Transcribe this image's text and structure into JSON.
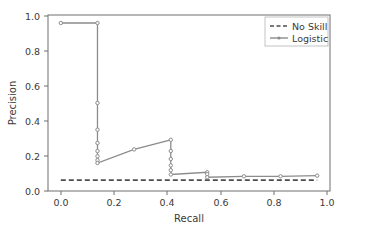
{
  "chart_data": {
    "type": "line",
    "title": "",
    "xlabel": "Recall",
    "ylabel": "Precision",
    "xlim": [
      -0.05,
      1.05
    ],
    "ylim": [
      -0.05,
      1.05
    ],
    "grid": false,
    "legend_position": "upper right",
    "xticks": [
      "0.0",
      "0.2",
      "0.4",
      "0.6",
      "0.8",
      "1.0"
    ],
    "xtick_values": [
      0.0,
      0.2,
      0.4,
      0.6,
      0.8,
      1.0
    ],
    "yticks": [
      "0.0",
      "0.2",
      "0.4",
      "0.6",
      "0.8",
      "1.0"
    ],
    "ytick_values": [
      0.0,
      0.2,
      0.4,
      0.6,
      0.8,
      1.0
    ],
    "series": [
      {
        "name": "No Skill",
        "style": "dashed",
        "marker": "none",
        "color": "#4d4d4d",
        "x": [
          0.0,
          1.0
        ],
        "values": [
          0.018,
          0.018
        ]
      },
      {
        "name": "Logistic",
        "style": "solid",
        "marker": "dot",
        "color": "#8c8c8c",
        "x": [
          0.0,
          0.143,
          0.143,
          0.143,
          0.143,
          0.143,
          0.143,
          0.143,
          0.143,
          0.286,
          0.429,
          0.429,
          0.429,
          0.429,
          0.429,
          0.429,
          0.571,
          0.571,
          0.571,
          0.714,
          0.857,
          1.0
        ],
        "values": [
          1.0,
          1.0,
          0.5,
          0.333,
          0.25,
          0.2,
          0.167,
          0.143,
          0.125,
          0.21,
          0.27,
          0.2,
          0.15,
          0.11,
          0.08,
          0.053,
          0.067,
          0.055,
          0.036,
          0.042,
          0.042,
          0.046
        ]
      }
    ]
  },
  "legend": {
    "entries": [
      {
        "label": "No Skill"
      },
      {
        "label": "Logistic"
      }
    ]
  },
  "axes": {
    "x_title": "Recall",
    "y_title": "Precision"
  },
  "colors": {
    "no_skill": "#4d4d4d",
    "logistic": "#8c8c8c",
    "spine": "#6e6e6e",
    "text": "#3a3a3a",
    "background": "#ffffff"
  }
}
